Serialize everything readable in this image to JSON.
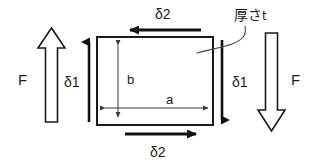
{
  "figure": {
    "background_color": "#ffffff",
    "stroke_color": "#1a1a1a",
    "plate": {
      "name": "rectangular-plate",
      "width_label": "a",
      "height_label": "b",
      "thickness_label": "厚さ t",
      "thickness_label_main": "厚さ",
      "thickness_label_symbol": "t"
    },
    "labels": {
      "force_left": "F",
      "force_right": "F",
      "delta1_left": "δ1",
      "delta1_right": "δ1",
      "delta2_top": "δ2",
      "delta2_bottom": "δ2",
      "dim_width": "a",
      "dim_height": "b"
    },
    "arrows": {
      "outline_left": {
        "label": "F",
        "direction": "up",
        "style": "outline"
      },
      "outline_right": {
        "label": "F",
        "direction": "down",
        "style": "outline"
      },
      "solid_left": {
        "label": "δ1",
        "direction": "up",
        "style": "solid"
      },
      "solid_right": {
        "label": "δ1",
        "direction": "down",
        "style": "solid"
      },
      "solid_top": {
        "label": "δ2",
        "direction": "left",
        "style": "solid"
      },
      "solid_bottom": {
        "label": "δ2",
        "direction": "right",
        "style": "solid"
      },
      "dim_horizontal": {
        "label": "a",
        "direction": "double",
        "style": "thin"
      },
      "dim_vertical": {
        "label": "b",
        "direction": "double",
        "style": "thin"
      }
    }
  }
}
